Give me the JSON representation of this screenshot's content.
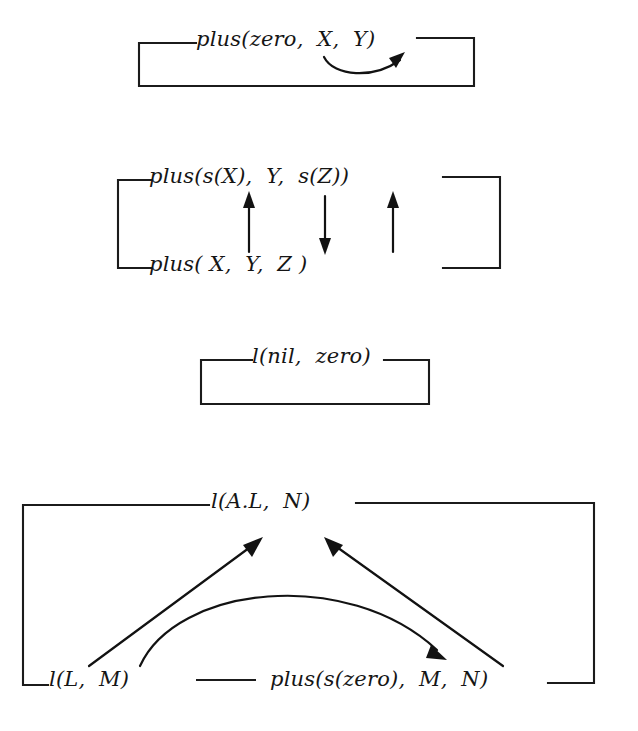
{
  "figure": {
    "kind": "clause-dataflow-diagram",
    "background_color": "#ffffff",
    "ink_color": "#151515",
    "clauses": [
      {
        "id": "clause-1",
        "head": "plus(zero,  X,  Y)",
        "head_parts": {
          "functor": "plus(",
          "arg1": "zero,",
          "arg2": "X,",
          "arg3": "Y)"
        },
        "body": "",
        "arrows": [
          {
            "name": "curved-arrow-x-to-y",
            "from": "X",
            "to": "Y",
            "style": "curved",
            "direction": "left-to-right"
          }
        ]
      },
      {
        "id": "clause-2",
        "head": "plus(s(X),  Y,  s(Z))",
        "head_parts": {
          "functor": "plus(",
          "arg1": "s(X),",
          "arg2": "Y,",
          "arg3": "s(Z))"
        },
        "body": "plus( X,  Y,  Z )",
        "body_parts": {
          "functor": "plus(",
          "arg1": "X,",
          "arg2": "Y,",
          "arg3": "Z )"
        },
        "arrows": [
          {
            "name": "arrow-up-arg1",
            "from": "X",
            "to": "s(X)",
            "style": "straight",
            "direction": "up"
          },
          {
            "name": "arrow-down-arg2",
            "from": "Y",
            "to": "Y",
            "style": "straight",
            "direction": "down"
          },
          {
            "name": "arrow-up-arg3",
            "from": "Z",
            "to": "s(Z)",
            "style": "straight",
            "direction": "up"
          }
        ]
      },
      {
        "id": "clause-3",
        "head": "l(nil,  zero)",
        "head_parts": {
          "functor": "l(",
          "arg1": "nil,",
          "arg2": "zero)"
        },
        "body": "",
        "arrows": []
      },
      {
        "id": "clause-4",
        "head": "l(A.L,  N)",
        "head_parts": {
          "functor": "l(",
          "arg1": "A.L,",
          "arg2": "N)"
        },
        "body_goal_1": "l(L,  M)",
        "body_goal_1_parts": {
          "functor": "l(",
          "arg1": "L,",
          "arg2": "M)"
        },
        "body_goal_2": "plus(s(zero),  M,  N)",
        "body_goal_2_parts": {
          "functor": "plus(",
          "arg1": "s(zero),",
          "arg2": "M,",
          "arg3": "N)"
        },
        "arrows": [
          {
            "name": "arrow-up-left-L-to-AL",
            "from": "l(L, M) : L",
            "to": "l(A.L, N) : A.L",
            "style": "straight",
            "direction": "up-right"
          },
          {
            "name": "arrow-curved-M-to-M",
            "from": "l(L, M) : M",
            "to": "plus(s(zero), M, N) : M",
            "style": "curved",
            "direction": "left-to-right"
          },
          {
            "name": "arrow-up-right-N-to-N",
            "from": "plus(s(zero), M, N) : N",
            "to": "l(A.L, N) : N",
            "style": "straight",
            "direction": "up-left"
          }
        ]
      }
    ]
  }
}
